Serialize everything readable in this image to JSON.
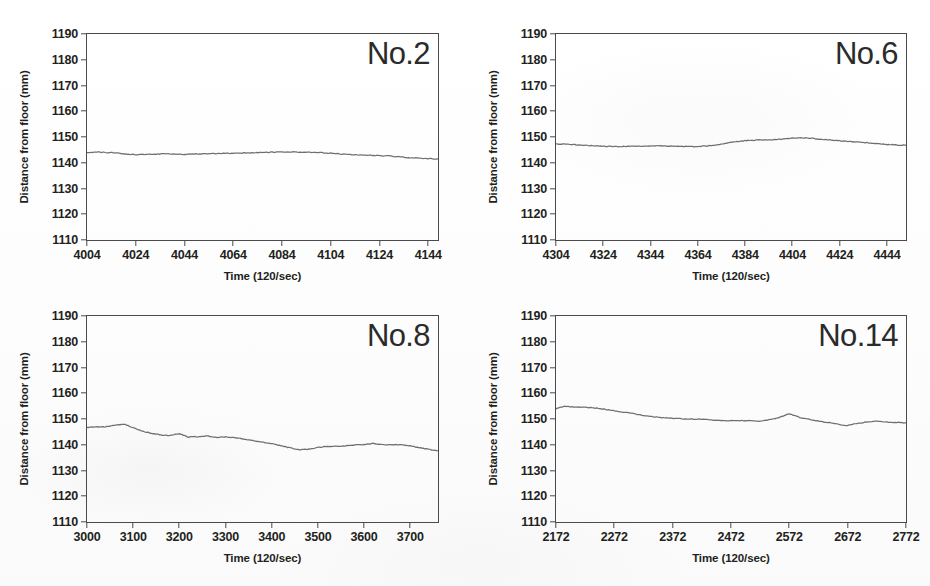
{
  "figure": {
    "type": "multi-panel-line-chart",
    "panel_count": 4,
    "layout": "2x2",
    "shared_ylabel": "Distance from floor (mm)",
    "shared_xlabel": "Time (120/sec)",
    "line_color": "#6f6f6f",
    "axis_color": "#4a4a4a",
    "background": "#ffffff"
  },
  "chart_data": [
    {
      "type": "line",
      "title": "No.2",
      "xlabel": "Time (120/sec)",
      "ylabel": "Distance from floor (mm)",
      "xlim": [
        4004,
        4148
      ],
      "ylim": [
        1110,
        1190
      ],
      "xticks": [
        4004,
        4024,
        4044,
        4064,
        4084,
        4104,
        4124,
        4144
      ],
      "yticks": [
        1110,
        1120,
        1130,
        1140,
        1150,
        1160,
        1170,
        1180,
        1190
      ],
      "grid": false,
      "legend": "none",
      "series": [
        {
          "name": "distance",
          "x": [
            4004,
            4008,
            4012,
            4016,
            4020,
            4024,
            4028,
            4032,
            4036,
            4040,
            4044,
            4048,
            4052,
            4056,
            4060,
            4064,
            4068,
            4072,
            4076,
            4080,
            4084,
            4088,
            4092,
            4096,
            4100,
            4104,
            4108,
            4112,
            4116,
            4120,
            4124,
            4128,
            4132,
            4136,
            4140,
            4144,
            4148
          ],
          "values": [
            1144.0,
            1144.1,
            1144.0,
            1143.8,
            1143.4,
            1143.2,
            1143.2,
            1143.3,
            1143.5,
            1143.4,
            1143.3,
            1143.4,
            1143.5,
            1143.5,
            1143.6,
            1143.7,
            1143.8,
            1143.9,
            1144.0,
            1144.1,
            1144.1,
            1144.2,
            1144.1,
            1144.0,
            1143.9,
            1143.7,
            1143.4,
            1143.2,
            1143.0,
            1142.9,
            1142.8,
            1142.6,
            1142.3,
            1142.0,
            1141.8,
            1141.6,
            1141.5
          ]
        }
      ]
    },
    {
      "type": "line",
      "title": "No.6",
      "xlabel": "Time (120/sec)",
      "ylabel": "Distance from floor (mm)",
      "xlim": [
        4304,
        4452
      ],
      "ylim": [
        1110,
        1190
      ],
      "xticks": [
        4304,
        4324,
        4344,
        4364,
        4384,
        4404,
        4424,
        4444
      ],
      "yticks": [
        1110,
        1120,
        1130,
        1140,
        1150,
        1160,
        1170,
        1180,
        1190
      ],
      "grid": false,
      "legend": "none",
      "series": [
        {
          "name": "distance",
          "x": [
            4304,
            4308,
            4312,
            4316,
            4320,
            4324,
            4328,
            4332,
            4336,
            4340,
            4344,
            4348,
            4352,
            4356,
            4360,
            4364,
            4368,
            4372,
            4376,
            4380,
            4384,
            4388,
            4392,
            4396,
            4400,
            4404,
            4408,
            4412,
            4416,
            4420,
            4424,
            4428,
            4432,
            4436,
            4440,
            4444,
            4448,
            4452
          ],
          "values": [
            1147.3,
            1147.2,
            1147.0,
            1146.8,
            1146.6,
            1146.4,
            1146.3,
            1146.3,
            1146.4,
            1146.4,
            1146.5,
            1146.5,
            1146.5,
            1146.4,
            1146.3,
            1146.3,
            1146.5,
            1147.0,
            1147.6,
            1148.2,
            1148.6,
            1148.8,
            1148.9,
            1148.9,
            1149.2,
            1149.6,
            1149.7,
            1149.5,
            1149.1,
            1148.8,
            1148.5,
            1148.2,
            1148.0,
            1147.8,
            1147.4,
            1147.1,
            1146.9,
            1146.8
          ]
        }
      ]
    },
    {
      "type": "line",
      "title": "No.8",
      "xlabel": "Time (120/sec)",
      "ylabel": "Distance from floor (mm)",
      "xlim": [
        3000,
        3760
      ],
      "ylim": [
        1110,
        1190
      ],
      "xticks": [
        3000,
        3100,
        3200,
        3300,
        3400,
        3500,
        3600,
        3700
      ],
      "yticks": [
        1110,
        1120,
        1130,
        1140,
        1150,
        1160,
        1170,
        1180,
        1190
      ],
      "grid": false,
      "legend": "none",
      "series": [
        {
          "name": "distance",
          "x": [
            3000,
            3020,
            3040,
            3060,
            3080,
            3100,
            3120,
            3140,
            3160,
            3180,
            3200,
            3220,
            3240,
            3260,
            3280,
            3300,
            3320,
            3340,
            3360,
            3380,
            3400,
            3420,
            3440,
            3460,
            3480,
            3500,
            3520,
            3540,
            3560,
            3580,
            3600,
            3620,
            3640,
            3660,
            3680,
            3700,
            3720,
            3740,
            3760
          ],
          "values": [
            1146.7,
            1146.9,
            1147.0,
            1147.6,
            1148.0,
            1146.6,
            1145.3,
            1144.4,
            1143.8,
            1143.6,
            1144.3,
            1143.0,
            1143.1,
            1143.4,
            1142.9,
            1143.0,
            1142.8,
            1142.2,
            1141.6,
            1141.0,
            1140.4,
            1139.6,
            1138.8,
            1138.0,
            1138.3,
            1139.0,
            1139.3,
            1139.4,
            1139.6,
            1139.9,
            1140.1,
            1140.5,
            1140.0,
            1140.1,
            1140.0,
            1139.5,
            1138.9,
            1138.2,
            1137.6
          ]
        }
      ]
    },
    {
      "type": "line",
      "title": "No.14",
      "xlabel": "Time (120/sec)",
      "ylabel": "Distance from floor (mm)",
      "xlim": [
        2172,
        2772
      ],
      "ylim": [
        1110,
        1190
      ],
      "xticks": [
        2172,
        2272,
        2372,
        2472,
        2572,
        2672,
        2772
      ],
      "yticks": [
        1110,
        1120,
        1130,
        1140,
        1150,
        1160,
        1170,
        1180,
        1190
      ],
      "grid": false,
      "legend": "none",
      "series": [
        {
          "name": "distance",
          "x": [
            2172,
            2187,
            2202,
            2222,
            2242,
            2262,
            2282,
            2302,
            2322,
            2342,
            2362,
            2382,
            2402,
            2422,
            2442,
            2462,
            2482,
            2502,
            2522,
            2542,
            2552,
            2562,
            2572,
            2582,
            2592,
            2612,
            2632,
            2652,
            2667,
            2682,
            2702,
            2722,
            2742,
            2762,
            2772
          ],
          "values": [
            1154.0,
            1155.0,
            1154.7,
            1154.5,
            1154.2,
            1153.5,
            1152.8,
            1152.2,
            1151.4,
            1150.8,
            1150.4,
            1150.2,
            1150.0,
            1149.9,
            1149.6,
            1149.4,
            1149.4,
            1149.4,
            1149.2,
            1149.8,
            1150.4,
            1151.2,
            1152.0,
            1151.3,
            1150.4,
            1149.6,
            1148.8,
            1148.2,
            1147.4,
            1148.0,
            1148.8,
            1149.2,
            1148.8,
            1148.6,
            1148.5
          ]
        }
      ]
    }
  ]
}
